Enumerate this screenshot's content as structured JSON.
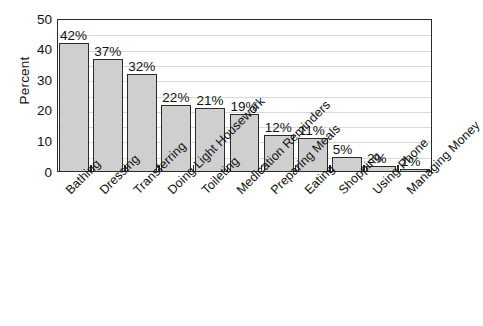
{
  "chart_data": {
    "type": "bar",
    "title": "",
    "subtitle": "",
    "xlabel": "",
    "ylabel": "Percent",
    "ylim": [
      0,
      50
    ],
    "y_ticks": [
      50,
      40,
      30,
      20,
      10,
      0
    ],
    "grid": true,
    "grid_interval": 5,
    "legend": "none",
    "orientation": "vertical",
    "categories": [
      "Bathing",
      "Dressing",
      "Transferring",
      "Doing Light Housework",
      "Toileting",
      "Medication Reminders",
      "Preparing Meals",
      "Eating",
      "Shopping",
      "Using Phone",
      "Managing Money"
    ],
    "values": [
      42,
      37,
      32,
      22,
      21,
      19,
      12,
      11,
      5,
      2,
      1
    ],
    "value_labels": [
      "42%",
      "37%",
      "32%",
      "22%",
      "21%",
      "19%",
      "12%",
      "11%",
      "5%",
      "2%",
      "1%"
    ],
    "bar_color": "#cfcfcf",
    "bar_border_color": "#2b2b2b",
    "grid_color": "#d9d9d9",
    "axis_color": "#2b2b2b",
    "background_color": "#ffffff"
  }
}
